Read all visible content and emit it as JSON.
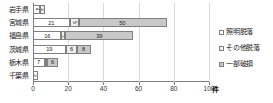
{
  "chart_data": {
    "type": "bar",
    "orientation": "horizontal",
    "stacked": true,
    "title": "",
    "xlabel": "件",
    "ylabel": "",
    "xlim": [
      0,
      100
    ],
    "xticks": [
      0,
      20,
      40,
      60,
      80,
      100
    ],
    "grid": true,
    "legend_position": "right",
    "categories": [
      "岩手県",
      "宮城県",
      "福島県",
      "茨城県",
      "栃木県",
      "千葉県"
    ],
    "series": [
      {
        "name": "照明脱落",
        "values": [
          4,
          21,
          16,
          19,
          7,
          3
        ]
      },
      {
        "name": "その他脱落",
        "values": [
          3,
          5,
          2,
          6,
          1,
          0
        ]
      },
      {
        "name": "一部破損",
        "values": [
          0,
          50,
          39,
          8,
          6,
          0
        ]
      }
    ],
    "colors": [
      "#ffffff",
      "#efefef",
      "#c8c8c8"
    ],
    "value_labels": [
      [
        "4",
        "3",
        ""
      ],
      [
        "21",
        "5",
        "50"
      ],
      [
        "16",
        "2",
        "39"
      ],
      [
        "19",
        "6",
        "8"
      ],
      [
        "7",
        "1",
        "6"
      ],
      [
        "3",
        "",
        ""
      ]
    ]
  }
}
